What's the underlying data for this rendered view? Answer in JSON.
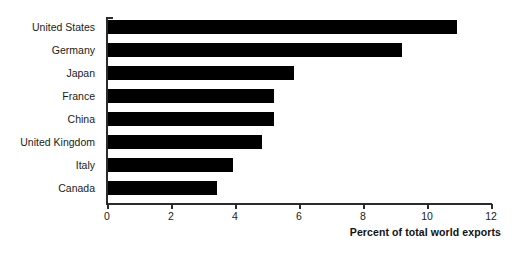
{
  "chart_data": {
    "type": "bar",
    "orientation": "horizontal",
    "title": "",
    "xlabel": "Percent of total world exports",
    "ylabel": "",
    "xlim": [
      0,
      12
    ],
    "ylim": null,
    "grid": false,
    "legend": null,
    "bar_color": "#000000",
    "axis_color": "#2b2b2b",
    "xticks": [
      0,
      2,
      4,
      6,
      8,
      10,
      12
    ],
    "xtick_labels": [
      "0",
      "2",
      "4",
      "6",
      "8",
      "10",
      "12"
    ],
    "categories": [
      "United States",
      "Germany",
      "Japan",
      "France",
      "China",
      "United Kingdom",
      "Italy",
      "Canada"
    ],
    "values": [
      10.9,
      9.2,
      5.8,
      5.2,
      5.2,
      4.8,
      3.9,
      3.4
    ],
    "series": [
      {
        "name": "Percent of total world exports",
        "values": [
          10.9,
          9.2,
          5.8,
          5.2,
          5.2,
          4.8,
          3.9,
          3.4
        ]
      }
    ]
  }
}
